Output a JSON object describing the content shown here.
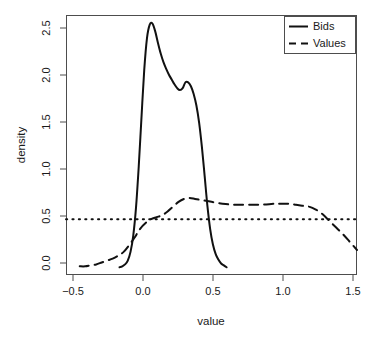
{
  "chart_data": {
    "type": "line",
    "title": "",
    "subtitle": "",
    "xlabel": "value",
    "ylabel": "density",
    "xlim": [
      -0.52,
      1.6
    ],
    "ylim": [
      -0.08,
      2.62
    ],
    "xticks": [
      -0.5,
      0.0,
      0.5,
      1.0,
      1.5
    ],
    "xtick_labels": [
      "−0.5",
      "0.0",
      "0.5",
      "1.0",
      "1.5"
    ],
    "yticks": [
      0.0,
      0.5,
      1.0,
      1.5,
      2.0,
      2.5
    ],
    "ytick_labels": [
      "0.0",
      "0.5",
      "1.0",
      "1.5",
      "2.0",
      "2.5"
    ],
    "grid": false,
    "legend_position": "top-right",
    "legend_entries": [
      {
        "label": "Bids",
        "style": "solid"
      },
      {
        "label": "Values",
        "style": "dashed"
      }
    ],
    "annotations": [
      {
        "name": "reference-line",
        "type": "hline",
        "y": 0.5,
        "style": "dotted",
        "label": ""
      }
    ],
    "series": [
      {
        "name": "Bids",
        "style": "solid",
        "color": "#111111",
        "x": [
          -0.13,
          -0.11,
          -0.09,
          -0.07,
          -0.05,
          -0.03,
          -0.01,
          0.01,
          0.03,
          0.05,
          0.07,
          0.09,
          0.11,
          0.13,
          0.15,
          0.17,
          0.19,
          0.21,
          0.23,
          0.25,
          0.27,
          0.29,
          0.31,
          0.33,
          0.35,
          0.37,
          0.39,
          0.41,
          0.43,
          0.45,
          0.47,
          0.49,
          0.51,
          0.53,
          0.55,
          0.57,
          0.59,
          0.61,
          0.63,
          0.65
        ],
        "y": [
          0.0,
          0.01,
          0.03,
          0.07,
          0.16,
          0.33,
          0.62,
          1.05,
          1.56,
          2.05,
          2.38,
          2.52,
          2.53,
          2.45,
          2.33,
          2.22,
          2.13,
          2.06,
          2.0,
          1.95,
          1.9,
          1.86,
          1.84,
          1.86,
          1.92,
          1.92,
          1.88,
          1.8,
          1.68,
          1.5,
          1.25,
          0.95,
          0.64,
          0.4,
          0.24,
          0.14,
          0.08,
          0.04,
          0.02,
          0.0
        ]
      },
      {
        "name": "Values",
        "style": "dashed",
        "color": "#111111",
        "x": [
          -0.42,
          -0.38,
          -0.34,
          -0.3,
          -0.26,
          -0.22,
          -0.18,
          -0.14,
          -0.1,
          -0.06,
          -0.02,
          0.02,
          0.06,
          0.1,
          0.14,
          0.18,
          0.22,
          0.26,
          0.3,
          0.34,
          0.38,
          0.42,
          0.46,
          0.5,
          0.54,
          0.58,
          0.62,
          0.7,
          0.8,
          0.9,
          1.0,
          1.05,
          1.1,
          1.15,
          1.2,
          1.25,
          1.3,
          1.35,
          1.4,
          1.45,
          1.5,
          1.55,
          1.6
        ],
        "y": [
          0.01,
          0.01,
          0.02,
          0.03,
          0.05,
          0.07,
          0.09,
          0.12,
          0.16,
          0.23,
          0.31,
          0.4,
          0.46,
          0.5,
          0.52,
          0.54,
          0.58,
          0.63,
          0.68,
          0.71,
          0.72,
          0.71,
          0.7,
          0.69,
          0.68,
          0.67,
          0.66,
          0.65,
          0.65,
          0.65,
          0.66,
          0.66,
          0.66,
          0.65,
          0.64,
          0.63,
          0.6,
          0.55,
          0.48,
          0.41,
          0.34,
          0.26,
          0.18
        ]
      }
    ]
  }
}
